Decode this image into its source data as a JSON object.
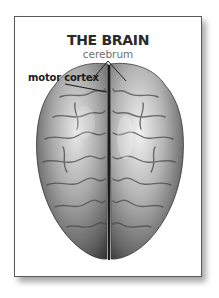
{
  "diagram": {
    "title": "THE BRAIN",
    "subtitle": "cerebrum",
    "labels": [
      {
        "text": "motor cortex",
        "target": "precentral gyrus region of left hemisphere"
      }
    ],
    "colors": {
      "frame_border": "#5a5a5a",
      "title_text": "#2a2a2a",
      "subtitle_text": "#6e6e6e",
      "label_text": "#1c1c1c",
      "brain_tone": "#9a9a9a"
    }
  }
}
